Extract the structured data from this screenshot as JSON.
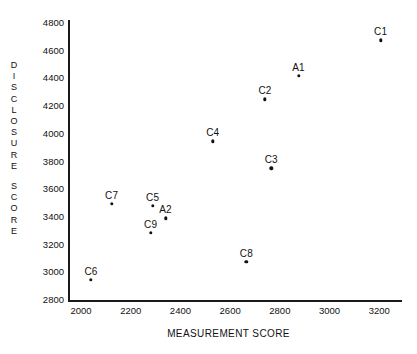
{
  "chart_data": {
    "type": "scatter",
    "title": "",
    "xlabel": "MEASUREMENT SCORE",
    "ylabel": "DISCLOSURE SCORE",
    "xlim": [
      1900,
      3300
    ],
    "ylim": [
      2800,
      4900
    ],
    "xticks": [
      "2000",
      "2200",
      "2400",
      "2600",
      "2800",
      "3000",
      "3200"
    ],
    "yticks": [
      "4800",
      "4600",
      "4400",
      "4200",
      "4000",
      "3800",
      "3600",
      "3400",
      "3200",
      "3000",
      "2800"
    ],
    "grid": false,
    "legend": "none",
    "points": [
      {
        "label": "C1",
        "x": 3205,
        "y": 4675,
        "label_pos": "above"
      },
      {
        "label": "A1",
        "x": 2875,
        "y": 4420,
        "label_pos": "above"
      },
      {
        "label": "C2",
        "x": 2740,
        "y": 4250,
        "label_pos": "above"
      },
      {
        "label": "C4",
        "x": 2530,
        "y": 3945,
        "label_pos": "above"
      },
      {
        "label": "C3",
        "x": 2765,
        "y": 3750,
        "label_pos": "above"
      },
      {
        "label": "C7",
        "x": 2123,
        "y": 3495,
        "label_pos": "above"
      },
      {
        "label": "C5",
        "x": 2288,
        "y": 3480,
        "label_pos": "above"
      },
      {
        "label": "A2",
        "x": 2340,
        "y": 3390,
        "label_pos": "above"
      },
      {
        "label": "C9",
        "x": 2280,
        "y": 3285,
        "label_pos": "above"
      },
      {
        "label": "C8",
        "x": 2665,
        "y": 3075,
        "label_pos": "above"
      },
      {
        "label": "C6",
        "x": 2040,
        "y": 2945,
        "label_pos": "above"
      }
    ]
  },
  "axis": {
    "y_title_chars": [
      "D",
      "I",
      "S",
      "C",
      "L",
      "O",
      "S",
      "U",
      "R",
      "E",
      "",
      "S",
      "C",
      "O",
      "R",
      "E"
    ],
    "x_title": "MEASUREMENT SCORE"
  }
}
